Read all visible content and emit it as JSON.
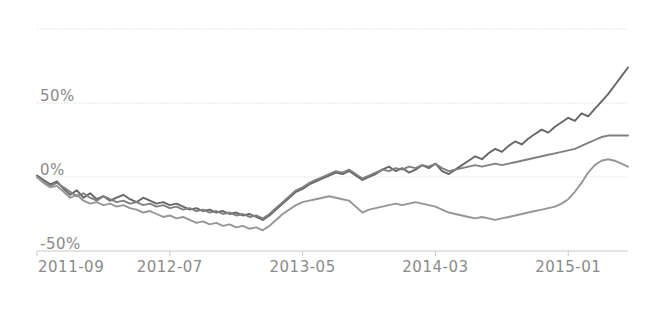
{
  "chart_data": {
    "type": "line",
    "title": "",
    "subtitle": "",
    "xlabel": "",
    "ylabel": "",
    "grid": true,
    "legend": "none",
    "xlim": [
      "2011-09",
      "2015-06"
    ],
    "ylim": [
      -50,
      100
    ],
    "ytick_labels": [
      "50%",
      "0%",
      "-50%"
    ],
    "ytick_values": [
      50,
      0,
      -50
    ],
    "gridline_values": [
      100,
      50,
      0
    ],
    "xtick_labels": [
      "2011-09",
      "2012-07",
      "2013-05",
      "2014-03",
      "2015-01"
    ],
    "xtick_positions": [
      0,
      10,
      20,
      30,
      40
    ],
    "x_unit": "months since 2011-09",
    "x_points": [
      0,
      0.5,
      1,
      1.5,
      2,
      2.5,
      3,
      3.5,
      4,
      4.5,
      5,
      5.5,
      6,
      6.5,
      7,
      7.5,
      8,
      8.5,
      9,
      9.5,
      10,
      10.5,
      11,
      11.5,
      12,
      12.5,
      13,
      13.5,
      14,
      14.5,
      15,
      15.5,
      16,
      16.5,
      17,
      17.5,
      18,
      18.5,
      19,
      19.5,
      20,
      20.5,
      21,
      21.5,
      22,
      22.5,
      23,
      23.5,
      24,
      24.5,
      25,
      25.5,
      26,
      26.5,
      27,
      27.5,
      28,
      28.5,
      29,
      29.5,
      30,
      30.5,
      31,
      31.5,
      32,
      32.5,
      33,
      33.5,
      34,
      34.5,
      35,
      35.5,
      36,
      36.5,
      37,
      37.5,
      38,
      38.5,
      39,
      39.5,
      40,
      40.5,
      41,
      41.5,
      42,
      42.5,
      43,
      43.5,
      44,
      44.5
    ],
    "series": [
      {
        "name": "series-1",
        "color": "#666666",
        "values": [
          1,
          -2,
          -5,
          -3,
          -8,
          -12,
          -9,
          -14,
          -11,
          -15,
          -13,
          -16,
          -14,
          -12,
          -15,
          -17,
          -14,
          -16,
          -18,
          -17,
          -19,
          -18,
          -20,
          -22,
          -21,
          -23,
          -22,
          -24,
          -23,
          -25,
          -24,
          -26,
          -25,
          -27,
          -29,
          -26,
          -22,
          -18,
          -14,
          -10,
          -8,
          -5,
          -3,
          -1,
          1,
          3,
          2,
          4,
          1,
          -2,
          0,
          2,
          5,
          7,
          4,
          6,
          3,
          5,
          8,
          6,
          9,
          4,
          2,
          5,
          8,
          11,
          14,
          12,
          16,
          19,
          17,
          21,
          24,
          22,
          26,
          29,
          32,
          30,
          34,
          37,
          40,
          38,
          43,
          41,
          46,
          51,
          56,
          62,
          68,
          74
        ]
      },
      {
        "name": "series-2",
        "color": "#808080",
        "values": [
          0,
          -3,
          -6,
          -4,
          -7,
          -10,
          -13,
          -11,
          -14,
          -16,
          -13,
          -15,
          -17,
          -16,
          -18,
          -17,
          -19,
          -18,
          -20,
          -19,
          -21,
          -20,
          -22,
          -21,
          -23,
          -22,
          -24,
          -23,
          -25,
          -24,
          -26,
          -25,
          -27,
          -26,
          -28,
          -25,
          -21,
          -17,
          -13,
          -9,
          -7,
          -4,
          -2,
          0,
          2,
          4,
          3,
          5,
          2,
          -1,
          1,
          3,
          5,
          4,
          6,
          5,
          7,
          6,
          8,
          7,
          9,
          6,
          4,
          5,
          6,
          7,
          8,
          7,
          8,
          9,
          8,
          9,
          10,
          11,
          12,
          13,
          14,
          15,
          16,
          17,
          18,
          19,
          21,
          23,
          25,
          27,
          28,
          28,
          28,
          28
        ]
      },
      {
        "name": "series-3",
        "color": "#969696",
        "values": [
          0,
          -4,
          -7,
          -6,
          -10,
          -14,
          -12,
          -16,
          -18,
          -17,
          -19,
          -18,
          -20,
          -19,
          -21,
          -22,
          -24,
          -23,
          -25,
          -27,
          -26,
          -28,
          -27,
          -29,
          -31,
          -30,
          -32,
          -31,
          -33,
          -32,
          -34,
          -33,
          -35,
          -34,
          -36,
          -33,
          -29,
          -25,
          -22,
          -19,
          -17,
          -16,
          -15,
          -14,
          -13,
          -14,
          -15,
          -16,
          -20,
          -24,
          -22,
          -21,
          -20,
          -19,
          -18,
          -19,
          -18,
          -17,
          -18,
          -19,
          -20,
          -22,
          -24,
          -25,
          -26,
          -27,
          -28,
          -27,
          -28,
          -29,
          -28,
          -27,
          -26,
          -25,
          -24,
          -23,
          -22,
          -21,
          -20,
          -18,
          -15,
          -10,
          -4,
          3,
          8,
          11,
          12,
          11,
          9,
          7
        ]
      }
    ]
  },
  "axis": {
    "ytick_labels": [
      "50%",
      "0%",
      "-50%"
    ],
    "xtick_labels": [
      "2011-09",
      "2012-07",
      "2013-05",
      "2014-03",
      "2015-01"
    ]
  },
  "colors": {
    "gridline": "#dcdcdc",
    "axis_line": "#c8c8c8",
    "tick_text": "#8a8a8a",
    "background": "#ffffff"
  }
}
